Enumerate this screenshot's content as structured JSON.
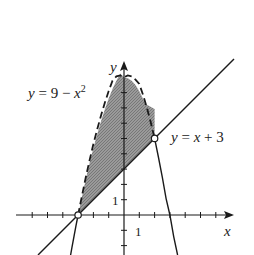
{
  "diagram": {
    "type": "region-between-curves",
    "curves": [
      {
        "name": "parabola",
        "equation_label": "y = 9 − x²",
        "label_parts": {
          "lhs": "y",
          "eq": " = 9 − ",
          "var": "x",
          "exp": "2"
        },
        "style": "dashed (boundary of region), solid outside"
      },
      {
        "name": "line",
        "equation_label": "y = x + 3",
        "label_parts": {
          "lhs": "y",
          "eq": " = ",
          "var": "x",
          "rest": " + 3"
        },
        "style": "solid"
      }
    ],
    "intersection_points": [
      {
        "x": -3,
        "y": 0,
        "marker": "open-circle"
      },
      {
        "x": 2,
        "y": 5,
        "marker": "open-circle"
      }
    ],
    "shaded_region": "x + 3 < y < 9 − x², −3 < x < 2",
    "axes": {
      "x_label": "x",
      "y_label": "y",
      "x_tick_label": "1",
      "y_tick_label": "1",
      "x_range": [
        -7,
        7
      ],
      "y_range": [
        -2.6,
        10
      ]
    },
    "colors": {
      "shade": "#8a8a8a",
      "stroke": "#1a1a1a",
      "marker_fill": "#ffffff"
    }
  }
}
